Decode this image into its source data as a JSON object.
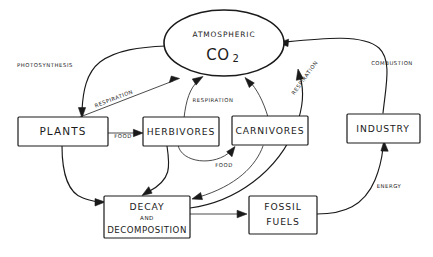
{
  "diagram": {
    "background_color": "#ffffff",
    "ink_color": "#1a1a1a",
    "atmosphere": {
      "line1": "ATMOSPHERIC",
      "line2": "CO",
      "subscript": "2"
    },
    "nodes": [
      {
        "id": "plants",
        "label": "PLANTS"
      },
      {
        "id": "herbivores",
        "label": "HERBIVORES"
      },
      {
        "id": "carnivores",
        "label": "CARNIVORES"
      },
      {
        "id": "industry",
        "label": "INDUSTRY"
      },
      {
        "id": "decay",
        "line1": "DECAY",
        "line2": "AND",
        "line3": "DECOMPOSITION"
      },
      {
        "id": "fossil",
        "line1": "FOSSIL",
        "line2": "FUELS"
      }
    ],
    "edge_labels": {
      "photosynthesis": "PHOTOSYNTHESIS",
      "respiration_plants": "RESPIRATION",
      "respiration_herbivores": "RESPIRATION",
      "respiration_carnivores": "RESPIRATION",
      "combustion": "COMBUSTION",
      "energy": "ENERGY",
      "food_plants_herbivores": "FOOD",
      "food_herbivores_carnivores": "FOOD"
    }
  }
}
